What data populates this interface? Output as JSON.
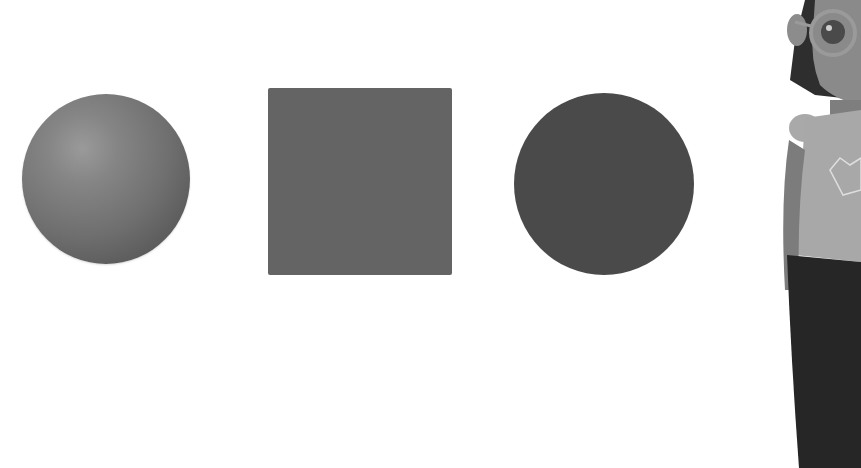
{
  "scene": {
    "background": "#ffffff",
    "shapes": [
      {
        "name": "sphere",
        "kind": "3d-solid",
        "color": "#6f6f6f",
        "shading": "radial-gradient"
      },
      {
        "name": "square",
        "kind": "2d-flat",
        "color": "#646464"
      },
      {
        "name": "circle",
        "kind": "2d-flat",
        "color": "#4a4a4a"
      }
    ],
    "character": {
      "description": "cartoon girl with round glasses, partially cropped at right edge",
      "shirt_color": "#a8a8a8",
      "pants_color": "#262626"
    }
  }
}
